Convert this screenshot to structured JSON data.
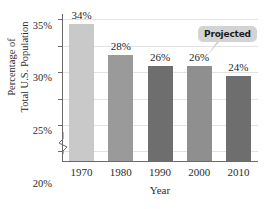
{
  "chart_data": {
    "type": "bar",
    "title": "",
    "xlabel": "Year",
    "ylabel": "Percentage of Total U.S. Population",
    "ylabel_lines": [
      "Percentage of",
      "Total U.S. Population"
    ],
    "categories": [
      "1970",
      "1980",
      "1990",
      "2000",
      "2010"
    ],
    "values": [
      34,
      28,
      26,
      26,
      24
    ],
    "value_labels": [
      "34%",
      "28%",
      "26%",
      "26%",
      "24%"
    ],
    "bar_colors": [
      "#c9c9c9",
      "#9a9a9a",
      "#6e6e6e",
      "#8f8f8f",
      "#6e6e6e"
    ],
    "ylim": [
      8,
      36
    ],
    "yticks": [
      10,
      15,
      20,
      25,
      30,
      35
    ],
    "ytick_labels": [
      "10%",
      "15%",
      "20%",
      "25%",
      "30%",
      "35%"
    ],
    "grid": true,
    "legend": "none",
    "axis_break": true,
    "annotations": [
      {
        "text": "Projected",
        "target_category": "2010",
        "style": "callout-bubble"
      }
    ]
  },
  "colors": {
    "axis": "#6a6a6a",
    "gridline": "#e3e3e6",
    "text": "#2b2b2b",
    "callout_bg": "#d3d3d3",
    "callout_text": "#1c1c1c",
    "background": "#ffffff"
  }
}
